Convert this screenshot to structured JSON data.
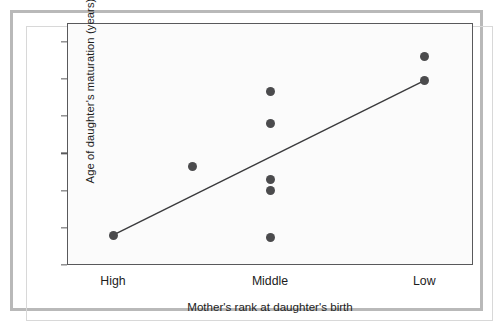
{
  "chart_data": {
    "type": "scatter",
    "title": "",
    "xlabel": "Mother's rank at daughter's birth",
    "ylabel": "Age of daughter's maturation (years)",
    "xlim": [
      0,
      3
    ],
    "ylim": [
      8,
      14.5
    ],
    "grid": false,
    "legend": "none",
    "xticks": [
      {
        "label": "High",
        "pos": 0.34
      },
      {
        "label": "Middle",
        "pos": 1.5
      },
      {
        "label": "Low",
        "pos": 2.64
      }
    ],
    "yticks": [
      8,
      9,
      10,
      11,
      12,
      13,
      14
    ],
    "series": [
      {
        "name": "Daughter maturation age",
        "marker": "filled-circle",
        "color": "#4b4b4d",
        "points": [
          {
            "rank": "High",
            "x": 0.34,
            "y": 8.8
          },
          {
            "rank": "Middle",
            "x": 0.93,
            "y": 10.65
          },
          {
            "rank": "Middle",
            "x": 1.5,
            "y": 12.65
          },
          {
            "rank": "Middle",
            "x": 1.5,
            "y": 11.8
          },
          {
            "rank": "Middle",
            "x": 1.5,
            "y": 10.3
          },
          {
            "rank": "Middle",
            "x": 1.5,
            "y": 10.0
          },
          {
            "rank": "Middle",
            "x": 1.5,
            "y": 8.75
          },
          {
            "rank": "Low",
            "x": 2.64,
            "y": 13.6
          },
          {
            "rank": "Low",
            "x": 2.64,
            "y": 12.95
          }
        ]
      }
    ],
    "trendline": {
      "name": "regression line",
      "color": "#3a3a3c",
      "x_start": 0.34,
      "y_start": 8.8,
      "x_end": 2.64,
      "y_end": 12.95
    }
  },
  "axis": {
    "ytick_labels": [
      "14",
      "13",
      "12",
      "11",
      "10",
      "9",
      "8"
    ],
    "ylabel_text": "Age of daughter's maturation (years)",
    "xlabel_text": "Mother's rank at daughter's birth",
    "xtick_labels": [
      "High",
      "Middle",
      "Low"
    ]
  },
  "colors": {
    "marker": "#4b4b4d",
    "line": "#3a3a3c",
    "axis": "#59595b",
    "frame": "#b9b9b9",
    "plot_background": "#fbfbfb",
    "page_background": "#ffffff",
    "text": "#1c1c1c"
  }
}
